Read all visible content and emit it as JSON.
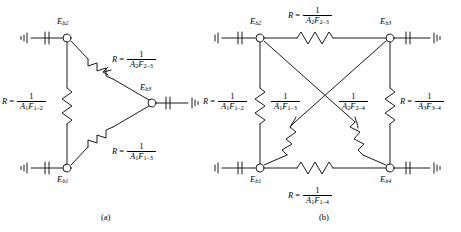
{
  "figure": {
    "type": "radiation-network-diagrams",
    "panels": [
      {
        "id": "a",
        "caption": "(a)",
        "nodes": [
          {
            "name": "Eb2",
            "label_main": "E",
            "label_sub": "b2"
          },
          {
            "name": "Eb1",
            "label_main": "E",
            "label_sub": "b1"
          },
          {
            "name": "Eb3",
            "label_main": "E",
            "label_sub": "b3"
          }
        ],
        "resistors": [
          {
            "name": "R-1-2",
            "prefix": "R",
            "equals": "=",
            "numerator": "1",
            "den_a": "A",
            "den_a_sub": "1",
            "den_f": "F",
            "den_f_sub": "1–2"
          },
          {
            "name": "R-2-3",
            "prefix": "R",
            "equals": "=",
            "numerator": "1",
            "den_a": "A",
            "den_a_sub": "2",
            "den_f": "F",
            "den_f_sub": "2–3"
          },
          {
            "name": "R-1-3",
            "prefix": "R",
            "equals": "=",
            "numerator": "1",
            "den_a": "A",
            "den_a_sub": "1",
            "den_f": "F",
            "den_f_sub": "1–3"
          }
        ]
      },
      {
        "id": "b",
        "caption": "(b)",
        "nodes": [
          {
            "name": "Eb2",
            "label_main": "E",
            "label_sub": "b2"
          },
          {
            "name": "Eb3",
            "label_main": "E",
            "label_sub": "b3"
          },
          {
            "name": "Eb1",
            "label_main": "E",
            "label_sub": "b1"
          },
          {
            "name": "Eb4",
            "label_main": "E",
            "label_sub": "b4"
          }
        ],
        "resistors": [
          {
            "name": "R-2-3",
            "prefix": "R",
            "equals": "=",
            "numerator": "1",
            "den_a": "A",
            "den_a_sub": "2",
            "den_f": "F",
            "den_f_sub": "2–3"
          },
          {
            "name": "R-1-2",
            "prefix": "R",
            "equals": "=",
            "numerator": "1",
            "den_a": "A",
            "den_a_sub": "1",
            "den_f": "F",
            "den_f_sub": "1–2"
          },
          {
            "name": "R-1-3",
            "prefix": "",
            "equals": "",
            "numerator": "1",
            "den_a": "A",
            "den_a_sub": "1",
            "den_f": "F",
            "den_f_sub": "1–3"
          },
          {
            "name": "R-2-4",
            "prefix": "",
            "equals": "",
            "numerator": "1",
            "den_a": "A",
            "den_a_sub": "2",
            "den_f": "F",
            "den_f_sub": "2–4"
          },
          {
            "name": "R-3-4",
            "prefix": "R",
            "equals": "=",
            "numerator": "1",
            "den_a": "A",
            "den_a_sub": "3",
            "den_f": "F",
            "den_f_sub": "3–4"
          },
          {
            "name": "R-1-4",
            "prefix": "R",
            "equals": "=",
            "numerator": "1",
            "den_a": "A",
            "den_a_sub": "1",
            "den_f": "F",
            "den_f_sub": "1–4"
          }
        ]
      }
    ],
    "colors": {
      "stroke": "#1a1a1a",
      "background": "#ffffff"
    }
  }
}
